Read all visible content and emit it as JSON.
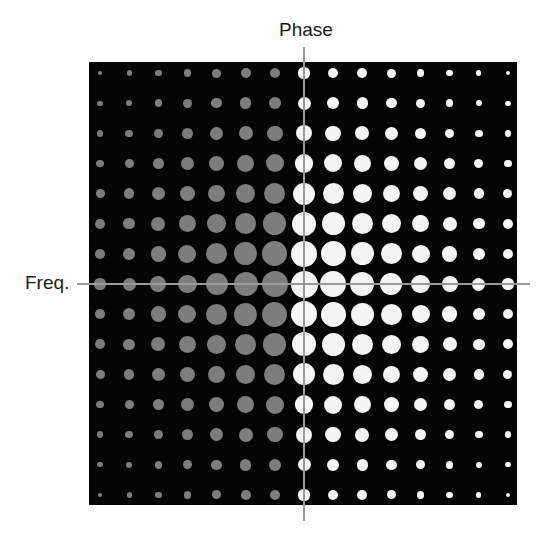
{
  "labels": {
    "phase": "Phase",
    "freq": "Freq."
  },
  "colors": {
    "background": "#ffffff",
    "square": "#050505",
    "dot_negative": "#7d7d7d",
    "dot_positive": "#f4f4f4",
    "axis_line": "#9a9a9a"
  },
  "layout": {
    "center_x": 304,
    "center_y": 284,
    "col_spacing": 29.14,
    "row_spacing": 30.14,
    "cols": 15,
    "rows": 15
  },
  "chart_data": {
    "type": "heatmap",
    "title": "",
    "xlabel": "Phase",
    "ylabel": "Freq.",
    "max_diameter_px": 27,
    "profile": [
      0.41,
      0.48,
      0.59,
      0.7,
      0.81,
      0.89,
      0.96,
      1.0,
      0.96,
      0.89,
      0.81,
      0.7,
      0.59,
      0.48,
      0.41
    ],
    "column_color": [
      "gray",
      "gray",
      "gray",
      "gray",
      "gray",
      "gray",
      "gray",
      "white",
      "white",
      "white",
      "white",
      "white",
      "white",
      "white",
      "white"
    ],
    "diameters": [
      [
        4.5,
        5.3,
        6.5,
        7.7,
        9.0,
        9.9,
        10.6,
        11.1,
        10.6,
        9.9,
        9.0,
        7.7,
        6.5,
        5.3,
        4.5
      ],
      [
        5.3,
        6.2,
        7.6,
        9.1,
        10.5,
        11.5,
        12.4,
        13.0,
        12.4,
        11.5,
        10.5,
        9.1,
        7.6,
        6.2,
        5.3
      ],
      [
        6.5,
        7.6,
        9.4,
        11.2,
        12.9,
        14.2,
        15.3,
        15.9,
        15.3,
        14.2,
        12.9,
        11.2,
        9.4,
        7.6,
        6.5
      ],
      [
        7.7,
        9.1,
        11.2,
        13.2,
        15.3,
        16.8,
        18.1,
        18.9,
        18.1,
        16.8,
        15.3,
        13.2,
        11.2,
        9.1,
        7.7
      ],
      [
        9.0,
        10.5,
        12.9,
        15.3,
        17.7,
        19.5,
        21.0,
        21.9,
        21.0,
        19.5,
        17.7,
        15.3,
        12.9,
        10.5,
        9.0
      ],
      [
        9.9,
        11.5,
        14.2,
        16.8,
        19.5,
        21.4,
        23.1,
        24.0,
        23.1,
        21.4,
        19.5,
        16.8,
        14.2,
        11.5,
        9.9
      ],
      [
        10.6,
        12.4,
        15.3,
        18.1,
        21.0,
        23.1,
        24.9,
        25.9,
        24.9,
        23.1,
        21.0,
        18.1,
        15.3,
        12.4,
        10.6
      ],
      [
        11.1,
        13.0,
        15.9,
        18.9,
        21.9,
        24.0,
        25.9,
        27.0,
        25.9,
        24.0,
        21.9,
        18.9,
        15.9,
        13.0,
        11.1
      ],
      [
        10.6,
        12.4,
        15.3,
        18.1,
        21.0,
        23.1,
        24.9,
        25.9,
        24.9,
        23.1,
        21.0,
        18.1,
        15.3,
        12.4,
        10.6
      ],
      [
        9.9,
        11.5,
        14.2,
        16.8,
        19.5,
        21.4,
        23.1,
        24.0,
        23.1,
        21.4,
        19.5,
        16.8,
        14.2,
        11.5,
        9.9
      ],
      [
        9.0,
        10.5,
        12.9,
        15.3,
        17.7,
        19.5,
        21.0,
        21.9,
        21.0,
        19.5,
        17.7,
        15.3,
        12.9,
        10.5,
        9.0
      ],
      [
        7.7,
        9.1,
        11.2,
        13.2,
        15.3,
        16.8,
        18.1,
        18.9,
        18.1,
        16.8,
        15.3,
        13.2,
        11.2,
        9.1,
        7.7
      ],
      [
        6.5,
        7.6,
        9.4,
        11.2,
        12.9,
        14.2,
        15.3,
        15.9,
        15.3,
        14.2,
        12.9,
        11.2,
        9.4,
        7.6,
        6.5
      ],
      [
        5.3,
        6.2,
        7.6,
        9.1,
        10.5,
        11.5,
        12.4,
        13.0,
        12.4,
        11.5,
        10.5,
        9.1,
        7.6,
        6.2,
        5.3
      ],
      [
        4.5,
        5.3,
        6.5,
        7.7,
        9.0,
        9.9,
        10.6,
        11.1,
        10.6,
        9.9,
        9.0,
        7.7,
        6.5,
        5.3,
        4.5
      ]
    ],
    "grid": false,
    "legend": null
  }
}
